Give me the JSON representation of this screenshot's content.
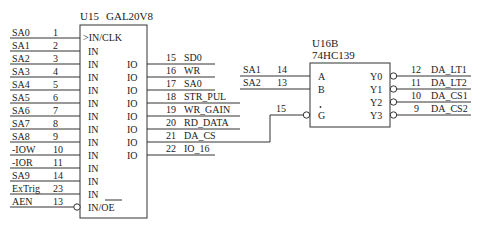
{
  "u15": {
    "ref": "U15",
    "part": "GAL20V8",
    "inputs": [
      {
        "net": "SA0",
        "pin": "1",
        "label": ">IN/CLK"
      },
      {
        "net": "SA1",
        "pin": "2",
        "label": "IN"
      },
      {
        "net": "SA2",
        "pin": "3",
        "label": "IN"
      },
      {
        "net": "SA3",
        "pin": "4",
        "label": "IN"
      },
      {
        "net": "SA4",
        "pin": "5",
        "label": "IN"
      },
      {
        "net": "SA5",
        "pin": "6",
        "label": "IN"
      },
      {
        "net": "SA6",
        "pin": "7",
        "label": "IN"
      },
      {
        "net": "SA7",
        "pin": "8",
        "label": "IN"
      },
      {
        "net": "SA8",
        "pin": "9",
        "label": "IN"
      },
      {
        "net": "-IOW",
        "pin": "10",
        "label": "IN"
      },
      {
        "net": "-IOR",
        "pin": "11",
        "label": "IN"
      },
      {
        "net": "SA9",
        "pin": "14",
        "label": "IN"
      },
      {
        "net": "ExTrig",
        "pin": "23",
        "label": "IN"
      },
      {
        "net": "AEN",
        "pin": "13",
        "label": "IN/OE"
      }
    ],
    "outputs": [
      {
        "pin": "15",
        "net": "SD0",
        "label": "IO"
      },
      {
        "pin": "16",
        "net": "WR",
        "label": "IO"
      },
      {
        "pin": "17",
        "net": "SA0",
        "label": "IO"
      },
      {
        "pin": "18",
        "net": "STR_PUL",
        "label": "IO"
      },
      {
        "pin": "19",
        "net": "WR_GAIN",
        "label": "IO"
      },
      {
        "pin": "20",
        "net": "RD_DATA",
        "label": "IO"
      },
      {
        "pin": "21",
        "net": "DA_CS",
        "label": "IO"
      },
      {
        "pin": "22",
        "net": "IO_16",
        "label": "IO"
      }
    ]
  },
  "u16b": {
    "ref": "U16B",
    "part": "74HC139",
    "inputs": [
      {
        "net": "SA1",
        "pin": "14",
        "label": "A"
      },
      {
        "net": "SA2",
        "pin": "13",
        "label": "B"
      },
      {
        "net": "",
        "pin": "15",
        "label": "G"
      }
    ],
    "outputs": [
      {
        "label": "Y0",
        "pin": "12",
        "net": "DA_LT1"
      },
      {
        "label": "Y1",
        "pin": "11",
        "net": "DA_LT2"
      },
      {
        "label": "Y2",
        "pin": "10",
        "net": "DA_CS1"
      },
      {
        "label": "Y3",
        "pin": "9",
        "net": "DA_CS2"
      }
    ]
  }
}
